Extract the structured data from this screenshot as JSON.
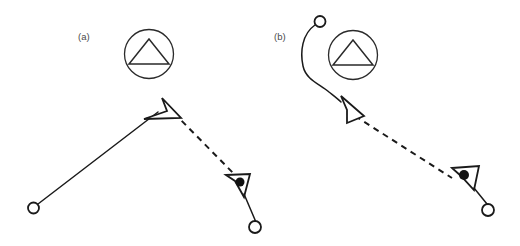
{
  "figure": {
    "width": 520,
    "height": 246,
    "background_color": "#ffffff",
    "line_color": "#1a1a1a",
    "fill_color": "#ffffff",
    "dot_color": "#111111",
    "label_color": "#4a4a4a"
  },
  "panels": [
    {
      "id": "a",
      "label": "(a)",
      "label_x": 78,
      "label_y": 40,
      "obstacle": {
        "name": "no-entry-triangle-sign",
        "circle": {
          "cx": 149,
          "cy": 54,
          "r": 24.5
        },
        "triangle": [
          [
            149,
            39
          ],
          [
            169,
            64
          ],
          [
            129,
            64
          ]
        ]
      },
      "start_node": {
        "cx": 33.5,
        "cy": 208,
        "r": 5.5
      },
      "goal_node": {
        "cx": 255,
        "cy": 227,
        "r": 6
      },
      "solid_path": "M 38 204 L 158 112",
      "dashed_path": "M 174 113 L 237 177",
      "waypoint_arrow": [
        [
          162,
          98
        ],
        [
          181,
          118
        ],
        [
          144,
          119
        ],
        [
          167,
          111
        ]
      ],
      "target_arrow": [
        [
          226,
          175
        ],
        [
          250,
          174
        ],
        [
          244,
          197
        ],
        [
          235,
          181
        ]
      ],
      "target_dot": {
        "cx": 240,
        "cy": 182,
        "r": 4.5
      },
      "goal_link": "M 244 194 L 255.5 221"
    },
    {
      "id": "b",
      "label": "(b)",
      "label_x": 274,
      "label_y": 40,
      "obstacle": {
        "name": "no-entry-triangle-sign",
        "circle": {
          "cx": 353,
          "cy": 55,
          "r": 24.5
        },
        "triangle": [
          [
            353,
            40
          ],
          [
            373,
            65
          ],
          [
            333,
            65
          ]
        ]
      },
      "start_node": {
        "cx": 320,
        "cy": 21.5,
        "r": 5.5
      },
      "goal_node": {
        "cx": 488,
        "cy": 210,
        "r": 6
      },
      "solid_path": "M 315 25 C 302 34 300 52 303 66 C 306 80 320 84 329 92 C 334 96 338 99 341 102",
      "dashed_path": "M 355 116 L 452 178",
      "waypoint_arrow": [
        [
          341,
          96
        ],
        [
          364,
          116
        ],
        [
          347,
          123
        ],
        [
          347,
          110
        ]
      ],
      "target_arrow": [
        [
          452,
          168
        ],
        [
          479,
          166
        ],
        [
          474,
          190
        ],
        [
          461,
          176
        ]
      ],
      "target_dot": {
        "cx": 464,
        "cy": 175,
        "r": 5
      },
      "goal_link": "M 474 188 L 487 204"
    }
  ],
  "legend_semantics": {
    "start_node": "open-circle-start-point",
    "goal_node": "open-circle-goal-point",
    "waypoint_arrow": "hollow-arrowhead-waypoint",
    "target_arrow": "arrowhead-with-filled-dot-target",
    "obstacle": "circled-triangle-obstacle-marker",
    "solid_path": "solid-trajectory-segment",
    "dashed_path": "dashed-trajectory-segment"
  }
}
